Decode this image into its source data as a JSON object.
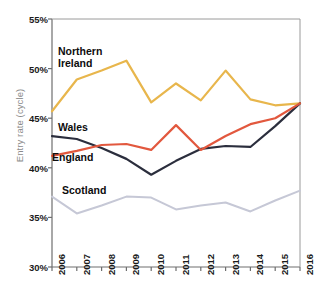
{
  "chart_data": {
    "type": "line",
    "title": "",
    "xlabel": "",
    "ylabel": "Entry rate (cycle)",
    "categories": [
      "2006",
      "2007",
      "2008",
      "2009",
      "2010",
      "2011",
      "2012",
      "2013",
      "2014",
      "2015",
      "2016"
    ],
    "ylim": [
      30,
      55
    ],
    "y_ticks": [
      "30%",
      "35%",
      "40%",
      "45%",
      "50%",
      "55%"
    ],
    "y_tick_values": [
      30,
      35,
      40,
      45,
      50,
      55
    ],
    "y_unit": "%",
    "grid": false,
    "legend_position": "inline-labels",
    "series": [
      {
        "name": "Northern Ireland",
        "color": "#E8B64C",
        "values": [
          45.7,
          48.9,
          49.8,
          50.8,
          46.6,
          48.5,
          46.8,
          49.8,
          46.9,
          46.3,
          46.5
        ]
      },
      {
        "name": "Wales",
        "color": "#2B2E3D",
        "values": [
          43.2,
          42.9,
          42.0,
          40.9,
          39.3,
          40.7,
          41.9,
          42.2,
          42.1,
          44.2,
          46.5
        ]
      },
      {
        "name": "England",
        "color": "#E2583E",
        "values": [
          41.2,
          41.7,
          42.3,
          42.4,
          41.8,
          44.3,
          41.8,
          43.2,
          44.4,
          45.0,
          46.5
        ]
      },
      {
        "name": "Scotland",
        "color": "#C6C8D6",
        "values": [
          37.1,
          35.4,
          36.2,
          37.1,
          37.0,
          35.8,
          36.2,
          36.5,
          35.6,
          36.7,
          37.7
        ]
      }
    ],
    "annotations": [
      {
        "text": "Northern",
        "text2": "Ireland",
        "series": "Northern Ireland"
      },
      {
        "text": "Wales",
        "series": "Wales"
      },
      {
        "text": "England",
        "series": "England"
      },
      {
        "text": "Scotland",
        "series": "Scotland"
      }
    ]
  },
  "axis_colors": {
    "axis_line": "#6e6e6e",
    "tick_label": "#1a1a1a",
    "axis_title": "#8b8b8b"
  }
}
